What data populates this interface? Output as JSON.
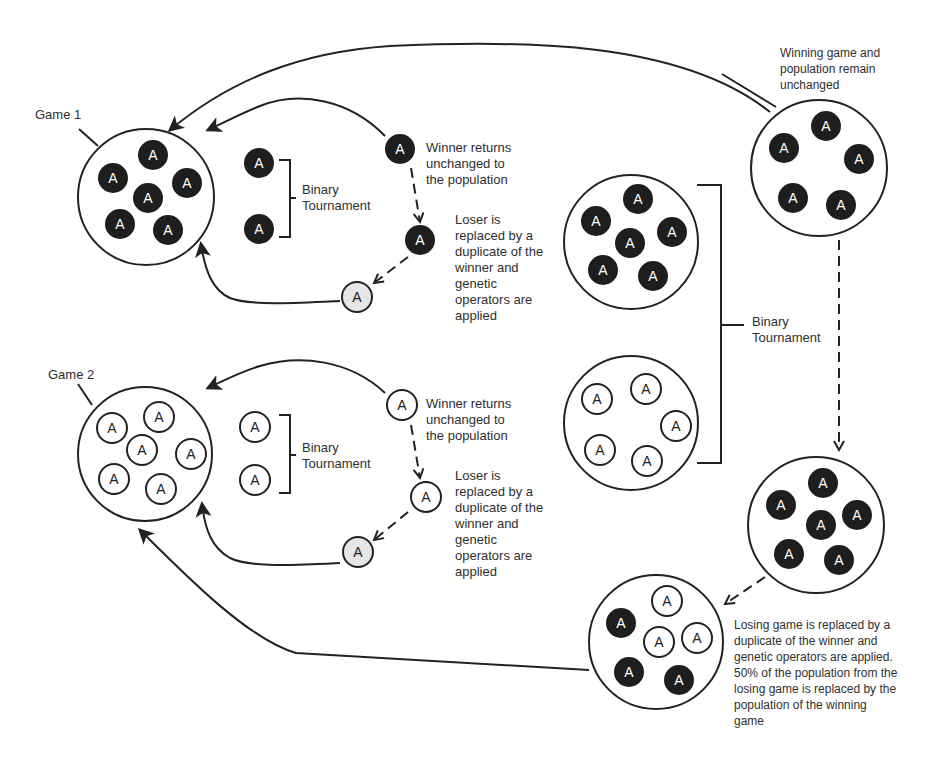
{
  "diagram": {
    "colors": {
      "dark_individual": "#1e1e1e",
      "light_individual": "#ffffff",
      "new_individual": "#e6e6e6",
      "stroke": "#222222",
      "text": "#2f2f2f"
    },
    "individual_label": "A",
    "game1": {
      "label": "Game 1",
      "population_type": "dark",
      "population_size": 6,
      "tournament": {
        "label_line1": "Binary",
        "label_line2": "Tournament",
        "competitors": [
          "A",
          "A"
        ]
      },
      "winner_note": [
        "Winner returns",
        "unchanged to",
        "the population"
      ],
      "loser_note": [
        "Loser is",
        "replaced by a",
        "duplicate of the",
        "winner and",
        "genetic",
        "operators are",
        "applied"
      ]
    },
    "game2": {
      "label": "Game 2",
      "population_type": "light",
      "population_size": 6,
      "tournament": {
        "label_line1": "Binary",
        "label_line2": "Tournament",
        "competitors": [
          "A",
          "A"
        ]
      },
      "winner_note": [
        "Winner returns",
        "unchanged to",
        "the population"
      ],
      "loser_note": [
        "Loser is",
        "replaced by a",
        "duplicate of the",
        "winner and",
        "genetic",
        "operators are",
        "applied"
      ]
    },
    "game_tournament": {
      "label_line1": "Binary",
      "label_line2": "Tournament",
      "game_a": {
        "population_type": "dark",
        "population_size": 6
      },
      "game_b": {
        "population_type": "light",
        "population_size": 5
      }
    },
    "winning_game_note": [
      "Winning game and",
      "population remain",
      "unchanged"
    ],
    "winning_game": {
      "population_type": "dark",
      "population_size": 5
    },
    "duplicated_winner": {
      "population_type": "dark",
      "population_size": 6
    },
    "losing_game_result": {
      "dark_count": 3,
      "light_count": 3
    },
    "losing_game_note": [
      "Losing game is replaced by a",
      "duplicate of the winner and",
      "genetic operators are applied.",
      "50% of the population from the",
      "losing game is replaced by the",
      "population of the winning",
      "game"
    ]
  }
}
